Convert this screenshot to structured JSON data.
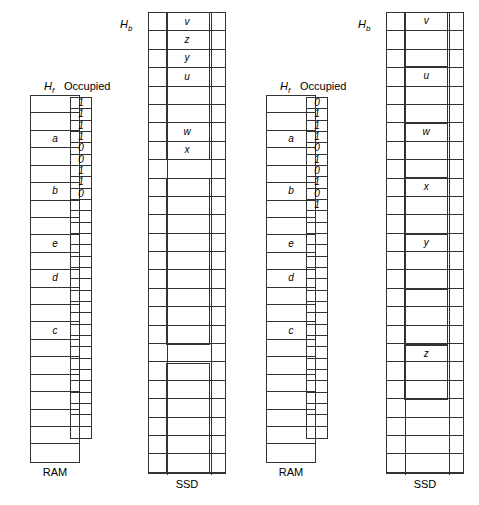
{
  "figure": {
    "panels": [
      {
        "id": "left",
        "ram": {
          "header": "H",
          "header_sub": "f",
          "footer": "RAM",
          "rows": 21,
          "labels": [
            "",
            "",
            "a",
            "",
            "",
            "b",
            "",
            "",
            "e",
            "",
            "d",
            "",
            "",
            "c",
            "",
            "",
            "",
            "",
            "",
            "",
            ""
          ]
        },
        "occupied": {
          "header": "Occupied",
          "rows": 30,
          "bits": [
            "1",
            "1",
            "1",
            "1",
            "0",
            "0",
            "1",
            "1",
            "0",
            "",
            "",
            "",
            "",
            "",
            "",
            "",
            "",
            "",
            "",
            "",
            "",
            "",
            "",
            "",
            "",
            "",
            "",
            "",
            "",
            ""
          ]
        },
        "ssd": {
          "header": "H",
          "header_sub": "b",
          "footer": "SSD",
          "rows": 25,
          "labels": [
            "v",
            "z",
            "y",
            "u",
            "",
            "",
            "w",
            "x",
            "",
            "",
            "",
            "",
            "",
            "",
            "",
            "",
            "",
            "",
            "",
            "",
            "",
            "",
            "",
            "",
            ""
          ]
        }
      },
      {
        "id": "right",
        "ram": {
          "header": "H",
          "header_sub": "f",
          "footer": "RAM",
          "rows": 21,
          "labels": [
            "",
            "",
            "a",
            "",
            "",
            "b",
            "",
            "",
            "e",
            "",
            "d",
            "",
            "",
            "c",
            "",
            "",
            "",
            "",
            "",
            "",
            ""
          ]
        },
        "occupied": {
          "header": "Occupied",
          "rows": 30,
          "bits": [
            "0",
            "1",
            "1",
            "1",
            "0",
            "1",
            "0",
            "1",
            "0",
            "1",
            "",
            "",
            "",
            "",
            "",
            "",
            "",
            "",
            "",
            "",
            "",
            "",
            "",
            "",
            "",
            "",
            "",
            "",
            "",
            ""
          ]
        },
        "ssd": {
          "header": "H",
          "header_sub": "b",
          "footer": "SSD",
          "rows": 25,
          "object_labels": [
            "v",
            "u",
            "w",
            "x",
            "y",
            "",
            "z"
          ]
        }
      }
    ]
  },
  "colors": {
    "stroke": "#333333",
    "background": "#ffffff",
    "text": "#000000"
  }
}
